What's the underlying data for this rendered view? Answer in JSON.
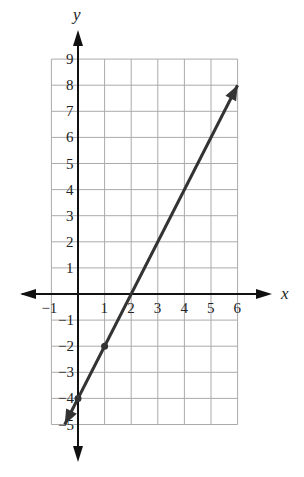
{
  "chart_data": {
    "type": "line",
    "title": "",
    "xlabel": "x",
    "ylabel": "y",
    "xlim": [
      -1,
      6
    ],
    "ylim": [
      -5,
      9
    ],
    "grid": true,
    "x_ticks": [
      "-1",
      "1",
      "2",
      "3",
      "4",
      "5",
      "6"
    ],
    "y_ticks": [
      "9",
      "8",
      "7",
      "6",
      "5",
      "4",
      "3",
      "2",
      "1",
      "-1",
      "-2",
      "-3",
      "-4",
      "-5"
    ],
    "series": [
      {
        "name": "line",
        "equation": "y = 2x - 4",
        "x": [
          -0.5,
          0,
          1,
          2,
          6
        ],
        "y": [
          -5,
          -4,
          -2,
          0,
          8
        ],
        "marked_points": [
          [
            0,
            -4
          ],
          [
            1,
            -2
          ]
        ],
        "arrows_both_ends": true,
        "color": "#333333"
      }
    ]
  }
}
